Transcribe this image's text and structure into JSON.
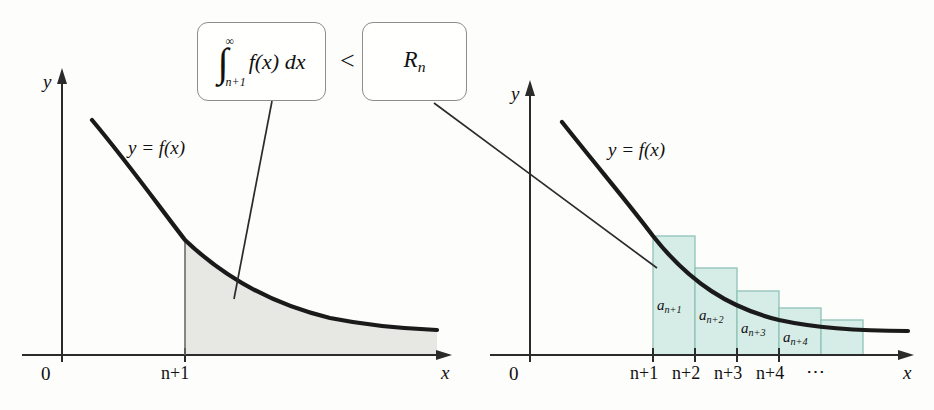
{
  "figure": {
    "type": "diagram",
    "relation_symbol": "<"
  },
  "callouts": [
    {
      "id": "integral-box",
      "integral_sign": "∫",
      "upper_limit": "∞",
      "lower_limit": "n+1",
      "integrand": "f(x) dx",
      "plain": "∫ n+1 to ∞ f(x) dx"
    },
    {
      "id": "rn-box",
      "base": "R",
      "subscript": "n",
      "plain": "R_n"
    }
  ],
  "left_chart": {
    "name": "integral-area-chart",
    "y_axis_label": "y",
    "x_axis_label": "x",
    "origin_label": "0",
    "curve_label": "y = f(x)",
    "x_ticks": [
      {
        "label": "n+1",
        "x": 185
      }
    ],
    "shaded_region_fill": "#e7e8e4",
    "shaded_region_meaning": "area under f from n+1 to infinity",
    "curve_color": "#1a1a1a",
    "axis_color": "#2b2b2b"
  },
  "right_chart": {
    "name": "series-rectangles-chart",
    "y_axis_label": "y",
    "x_axis_label": "x",
    "origin_label": "0",
    "curve_label": "y = f(x)",
    "x_ticks": [
      {
        "label": "n+1",
        "x": 653
      },
      {
        "label": "n+2",
        "x": 695
      },
      {
        "label": "n+3",
        "x": 737
      },
      {
        "label": "n+4",
        "x": 779
      }
    ],
    "ellipsis": "⋯",
    "rect_fill": "#d6ece6",
    "rect_stroke": "#8fc3b8",
    "curve_color": "#1a1a1a",
    "axis_color": "#2b2b2b",
    "rectangles": [
      {
        "label_base": "a",
        "label_sub": "n+1",
        "plain": "a_{n+1}",
        "x": 653,
        "width": 42,
        "top": 236
      },
      {
        "label_base": "a",
        "label_sub": "n+2",
        "plain": "a_{n+2}",
        "x": 695,
        "width": 42,
        "top": 268
      },
      {
        "label_base": "a",
        "label_sub": "n+3",
        "plain": "a_{n+3}",
        "x": 737,
        "width": 42,
        "top": 291
      },
      {
        "label_base": "a",
        "label_sub": "n+4",
        "plain": "a_{n+4}",
        "x": 779,
        "width": 42,
        "top": 308
      },
      {
        "label_base": "",
        "label_sub": "",
        "plain": "",
        "x": 821,
        "width": 42,
        "top": 320
      }
    ]
  }
}
